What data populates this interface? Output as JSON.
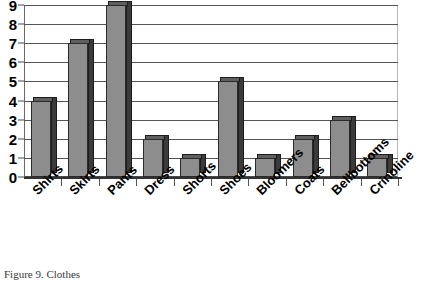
{
  "caption": "Figure 9. Clothes",
  "chart_data": {
    "type": "bar",
    "title": "",
    "xlabel": "",
    "ylabel": "",
    "categories": [
      "Shirts",
      "Skirts",
      "Pants",
      "Dress",
      "Shorts",
      "Shoes",
      "Bloomers",
      "Coats",
      "Bellbottoms",
      "Crinoline"
    ],
    "values": [
      4,
      7,
      9,
      2,
      1,
      5,
      1,
      2,
      3,
      1
    ],
    "ylim": [
      0,
      9
    ],
    "yticks": [
      0,
      1,
      2,
      3,
      4,
      5,
      6,
      7,
      8,
      9
    ],
    "ytick_labels": [
      "0",
      "1",
      "2",
      "3",
      "4",
      "5",
      "6",
      "7",
      "8",
      "9"
    ],
    "grid": true,
    "legend": false,
    "style": "3d-bar",
    "colors": {
      "bar_face": "#8d8d8d",
      "bar_side": "#3b3b3b",
      "bar_top": "#5f5f5f",
      "bar_outline": "#2b2b2b",
      "gridline": "#555555",
      "axis": "#333333",
      "background": "#ffffff",
      "text": "#000000",
      "caption_text": "#3a3a3a"
    }
  }
}
